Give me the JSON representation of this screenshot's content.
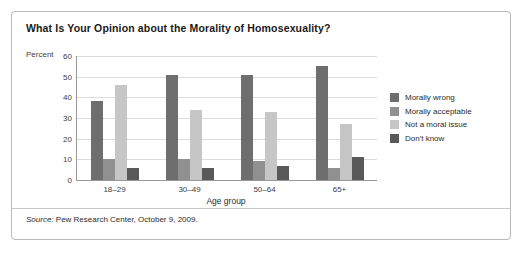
{
  "card": {
    "title": "What Is Your Opinion about the Morality of Homosexuality?",
    "source_label": "Source:",
    "source_text": " Pew Research Center, October 9, 2009."
  },
  "chart_data": {
    "type": "bar",
    "title": "What Is Your Opinion about the Morality of Homosexuality?",
    "xlabel": "Age group",
    "ylabel": "Percent",
    "ylim": [
      0,
      60
    ],
    "yticks": [
      0,
      10,
      20,
      30,
      40,
      50,
      60
    ],
    "grid": true,
    "legend_position": "right",
    "categories": [
      "18–29",
      "30–49",
      "50–64",
      "65+"
    ],
    "series": [
      {
        "name": "Morally wrong",
        "color": "#6e6e6e",
        "values": [
          38,
          51,
          51,
          55
        ]
      },
      {
        "name": "Morally acceptable",
        "color": "#909090",
        "values": [
          10,
          10,
          9,
          6
        ]
      },
      {
        "name": "Not a moral issue",
        "color": "#c6c6c6",
        "values": [
          46,
          34,
          33,
          27
        ]
      },
      {
        "name": "Don't know",
        "color": "#595959",
        "values": [
          6,
          6,
          7,
          11
        ]
      }
    ]
  }
}
